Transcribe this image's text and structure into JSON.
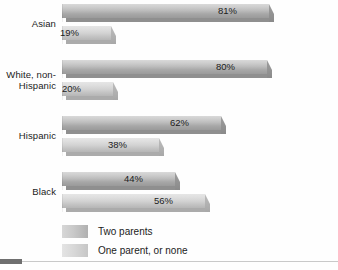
{
  "chart_data": {
    "type": "bar",
    "orientation": "horizontal",
    "title": "",
    "subtitle": "",
    "xlabel": "",
    "ylabel": "",
    "xlim": [
      0,
      100
    ],
    "grid": false,
    "legend_position": "bottom-left",
    "categories": [
      "Asian",
      "White, non-Hispanic",
      "Hispanic",
      "Black"
    ],
    "series": [
      {
        "name": "Two parents",
        "values": [
          81,
          80,
          62,
          44
        ],
        "value_labels": [
          "81%",
          "80%",
          "62%",
          "44%"
        ],
        "color": "#bdbdbd"
      },
      {
        "name": "One parent, or none",
        "values": [
          19,
          20,
          38,
          56
        ],
        "value_labels": [
          "19%",
          "20%",
          "38%",
          "56%"
        ],
        "color": "#d6d6d6"
      }
    ]
  },
  "groups": [
    {
      "label": "Asian",
      "label_lines": [
        "Asian"
      ],
      "bars": [
        {
          "series": "Two parents",
          "value": 81,
          "label": "81%"
        },
        {
          "series": "One parent, or none",
          "value": 19,
          "label": "19%"
        }
      ]
    },
    {
      "label": "White, non-Hispanic",
      "label_lines": [
        "White, non-",
        "Hispanic"
      ],
      "bars": [
        {
          "series": "Two parents",
          "value": 80,
          "label": "80%"
        },
        {
          "series": "One parent, or none",
          "value": 20,
          "label": "20%"
        }
      ]
    },
    {
      "label": "Hispanic",
      "label_lines": [
        "Hispanic"
      ],
      "bars": [
        {
          "series": "Two parents",
          "value": 62,
          "label": "62%"
        },
        {
          "series": "One parent, or none",
          "value": 38,
          "label": "38%"
        }
      ]
    },
    {
      "label": "Black",
      "label_lines": [
        "Black"
      ],
      "bars": [
        {
          "series": "Two parents",
          "value": 44,
          "label": "44%"
        },
        {
          "series": "One parent, or none",
          "value": 56,
          "label": "56%"
        }
      ]
    }
  ],
  "legend": {
    "items": [
      {
        "label": "Two parents",
        "swatch": "#bdbdbd"
      },
      {
        "label": "One parent, or none",
        "swatch": "#d6d6d6"
      }
    ]
  },
  "layout": {
    "plot_left": 62,
    "plot_width_100pct": 256,
    "group_tops": [
      4,
      60,
      116,
      172
    ],
    "bar_height": 18,
    "bar_gap": 4
  }
}
